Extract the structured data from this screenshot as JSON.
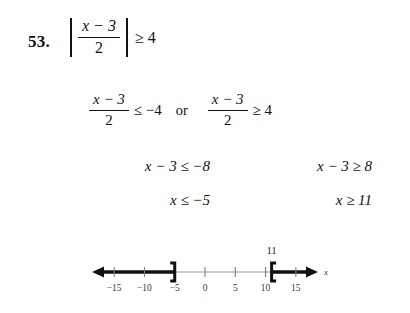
{
  "problem": {
    "number": "53."
  },
  "statement": {
    "numerator": "x − 3",
    "denominator": "2",
    "relation": "≥",
    "right_side": "4",
    "tail": "≥ 4"
  },
  "step_or": {
    "left": {
      "numerator": "x − 3",
      "denominator": "2",
      "relation": "≤",
      "right_side": "−4",
      "tail": "≤ −4"
    },
    "conjunction": "or",
    "right": {
      "numerator": "x − 3",
      "denominator": "2",
      "relation": "≥",
      "right_side": "4",
      "tail": "≥ 4"
    }
  },
  "step_multiply": {
    "left": "x − 3 ≤ −8",
    "right": "x − 3 ≥ 8"
  },
  "step_solution": {
    "left": "x ≤ −5",
    "right": "x ≥ 11"
  },
  "number_line": {
    "axis_label": "x",
    "tick_labels": [
      "−15",
      "−10",
      "−5",
      "0",
      "5",
      "10",
      "15"
    ],
    "tick_values": [
      -15,
      -10,
      -5,
      0,
      5,
      10,
      15
    ],
    "axis_min": -18,
    "axis_max": 18,
    "point_label_right": "11",
    "left_endpoint": {
      "value": -5,
      "bracket": "]",
      "type": "closed",
      "ray_direction": "left"
    },
    "right_endpoint": {
      "value": 11,
      "bracket": "[",
      "type": "closed",
      "ray_direction": "right"
    },
    "line_color": "#111111",
    "thin_line_color": "#9a9a9a"
  }
}
